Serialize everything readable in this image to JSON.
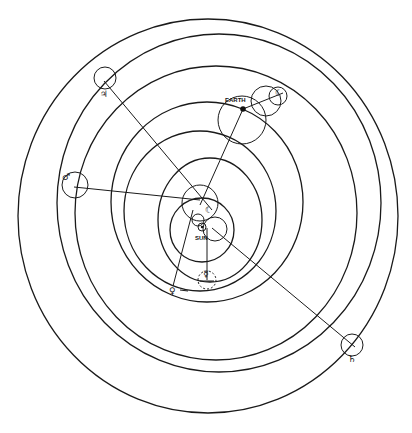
{
  "diagram": {
    "type": "geocentric planetary orbit diagram with epicycles",
    "colors": {
      "line": "#1a1a1a",
      "background": "#ffffff"
    },
    "labels": {
      "earth": "EARTH",
      "sun": "SUN"
    },
    "symbols": {
      "jupiter": "♃",
      "mars": "♂",
      "saturn": "♄",
      "venus": "♀",
      "mercury": "☿",
      "moon": "☾",
      "sun": "☉",
      "earth_marker": "☽"
    },
    "orbits": [
      {
        "name": "outer-orbit-1",
        "cx": 208,
        "cy": 216,
        "rx": 190,
        "ry": 197
      },
      {
        "name": "outer-orbit-2",
        "cx": 219,
        "cy": 203,
        "rx": 162,
        "ry": 169
      },
      {
        "name": "outer-orbit-3",
        "cx": 216,
        "cy": 213,
        "rx": 141,
        "ry": 147
      },
      {
        "name": "orbit-4",
        "cx": 207,
        "cy": 202,
        "rx": 96,
        "ry": 100
      },
      {
        "name": "orbit-5",
        "cx": 200,
        "cy": 211,
        "rx": 76,
        "ry": 80
      },
      {
        "name": "orbit-6",
        "cx": 210,
        "cy": 220,
        "rx": 52,
        "ry": 62
      },
      {
        "name": "orbit-7",
        "cx": 202,
        "cy": 230,
        "rx": 32,
        "ry": 32
      }
    ],
    "planets": [
      {
        "name": "jupiter",
        "x": 104,
        "y": 81
      },
      {
        "name": "mars",
        "x": 74,
        "y": 187
      },
      {
        "name": "saturn",
        "x": 355,
        "y": 347
      },
      {
        "name": "venus",
        "x": 173,
        "y": 286
      },
      {
        "name": "mercury",
        "x": 207,
        "y": 280
      },
      {
        "name": "earth",
        "x": 243,
        "y": 109
      }
    ]
  }
}
